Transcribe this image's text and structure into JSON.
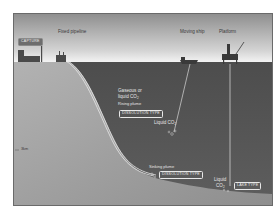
{
  "diagram": {
    "labels": {
      "capture": "CAPTURE",
      "fixed_pipeline": "Fixed pipeline",
      "moving_ship": "Moving ship",
      "platform": "Platform",
      "gaseous_line1": "Gaseous or",
      "gaseous_line2": "liquid CO",
      "gaseous_sub": "2",
      "rising_plume": "Rising plume",
      "dissolution_type_upper": "DISSOLUTION TYPE",
      "liquid_co2_mid": "Liquid CO",
      "liquid_co2_mid_sub": "2",
      "sinking_plume": "Sinking plume",
      "dissolution_type_lower": "DISSOLUTION TYPE",
      "liquid_bottom_line1": "Liquid",
      "liquid_bottom_line2": "CO",
      "liquid_bottom_sub": "2",
      "lake_type": "LAKE TYPE",
      "depth_marker": "3km"
    },
    "colors": {
      "sky_top": "#9a9a9a",
      "sky_bottom": "#f2f2f2",
      "sea": "#555555",
      "seabed": "#a8a8a8",
      "pipeline": "#e0e0e0",
      "frame": "#6a6a6a"
    }
  }
}
